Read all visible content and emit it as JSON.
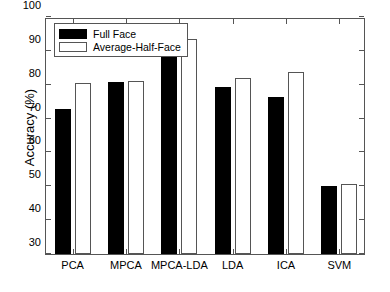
{
  "chart_data": {
    "type": "bar",
    "title": "",
    "xlabel": "",
    "ylabel": "Accuracy (%)",
    "categories": [
      "PCA",
      "MPCA",
      "MPCA-LDA",
      "LDA",
      "ICA",
      "SVM"
    ],
    "series": [
      {
        "name": "Full Face",
        "values": [
          72.8,
          80.9,
          91.5,
          79.4,
          76.5,
          50.0
        ]
      },
      {
        "name": "Average-Half-Face",
        "values": [
          80.4,
          81.0,
          93.4,
          82.0,
          83.7,
          50.7
        ]
      }
    ],
    "ylim": [
      30,
      100
    ],
    "yticks": [
      30,
      40,
      50,
      60,
      70,
      80,
      90,
      100
    ],
    "ytick_labels": [
      "30",
      "40",
      "50",
      "60",
      "70",
      "80",
      "90",
      "100"
    ],
    "grid": false,
    "legend_position": "top-left",
    "colors": {
      "full_face": "#000000",
      "average_half_face": "#ffffff",
      "axis": "#555555",
      "background": "#ffffff"
    }
  },
  "legend": {
    "entries": [
      {
        "label": "Full Face"
      },
      {
        "label": "Average-Half-Face"
      }
    ]
  }
}
